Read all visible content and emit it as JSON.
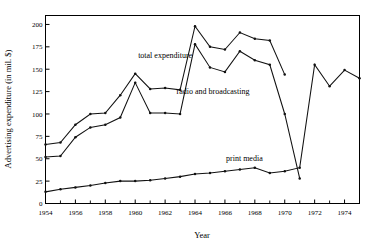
{
  "chart_data": {
    "type": "line",
    "title": "",
    "xlabel": "Year",
    "ylabel": "Advertising expenditure (in mil. $)",
    "xlim": [
      1954,
      1975
    ],
    "ylim": [
      0,
      210
    ],
    "ytick_values": [
      0,
      25,
      50,
      75,
      100,
      125,
      150,
      175,
      200
    ],
    "ytick_labels": [
      "0",
      "25",
      "50",
      "75",
      "100",
      "125",
      "150",
      "175",
      "200"
    ],
    "xtick_values": [
      1954,
      1956,
      1958,
      1960,
      1962,
      1964,
      1966,
      1968,
      1970,
      1972,
      1974
    ],
    "xtick_labels": [
      "1954",
      "1956",
      "1958",
      "1960",
      "1962",
      "1964",
      "1966",
      "1968",
      "1970",
      "1972",
      "1974"
    ],
    "xtick_minor": [
      1955,
      1957,
      1959,
      1961,
      1963,
      1965,
      1967,
      1969,
      1971,
      1973,
      1975
    ],
    "grid": false,
    "legend_position": "inline-annotations",
    "frame": "box",
    "markers": "filled-dot",
    "series": [
      {
        "name": "total expenditure",
        "label": "total expenditure",
        "label_x": 1962.0,
        "label_y": 163,
        "color": "#111111",
        "x": [
          1954,
          1955,
          1956,
          1957,
          1958,
          1959,
          1960,
          1961,
          1962,
          1963,
          1964,
          1965,
          1966,
          1967,
          1968,
          1969,
          1970
        ],
        "values": [
          66,
          68,
          88,
          100,
          101,
          121,
          145,
          128,
          129,
          127,
          198,
          175,
          172,
          191,
          184,
          182,
          144
        ]
      },
      {
        "name": "radio and broadcasting",
        "label": "radio and broadcasting",
        "label_x": 1965.2,
        "label_y": 122,
        "color": "#111111",
        "x": [
          1954,
          1955,
          1956,
          1957,
          1958,
          1959,
          1960,
          1961,
          1962,
          1963,
          1964,
          1965,
          1966,
          1967,
          1968,
          1969,
          1970,
          1971
        ],
        "values": [
          52,
          53,
          74,
          85,
          88,
          96,
          135,
          101,
          101,
          100,
          178,
          152,
          147,
          170,
          160,
          155,
          100,
          28
        ]
      },
      {
        "name": "print media",
        "label": "print media",
        "label_x": 1967.3,
        "label_y": 48,
        "color": "#111111",
        "x": [
          1954,
          1955,
          1956,
          1957,
          1958,
          1959,
          1960,
          1961,
          1962,
          1963,
          1964,
          1965,
          1966,
          1967,
          1968,
          1969,
          1970,
          1971,
          1972,
          1973,
          1974,
          1975
        ],
        "values": [
          13,
          16,
          18,
          20,
          23,
          25,
          25,
          26,
          28,
          30,
          33,
          34,
          36,
          38,
          40,
          34,
          36,
          40,
          155,
          131,
          149,
          140
        ]
      }
    ]
  },
  "axes": {
    "y_title": "Advertising expenditure (in mil. $)",
    "x_title": "Year"
  }
}
